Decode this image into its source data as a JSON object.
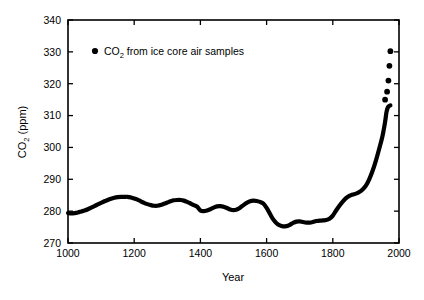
{
  "chart_data": {
    "type": "scatter",
    "title": "",
    "xlabel": "Year",
    "ylabel": "CO2 (ppm)",
    "ylabel_base": "CO",
    "ylabel_sub": "2",
    "ylabel_unit": " (ppm)",
    "xlim": [
      1000,
      2000
    ],
    "ylim": [
      270,
      340
    ],
    "grid": false,
    "legend_position": "upper-left-inside",
    "marker_color": "#000000",
    "xticks": [
      1000,
      1200,
      1400,
      1600,
      1800,
      2000
    ],
    "xtick_labels": [
      "1000",
      "1200",
      "1400",
      "1600",
      "1800",
      "2000"
    ],
    "yticks": [
      270,
      280,
      290,
      300,
      310,
      320,
      330,
      340
    ],
    "ytick_labels": [
      "270",
      "280",
      "290",
      "300",
      "310",
      "320",
      "330",
      "340"
    ],
    "legend": [
      {
        "marker": "filled-circle",
        "label": "CO2 from ice core air samples",
        "label_base": "CO",
        "label_sub": "2",
        "label_rest": " from ice core air samples"
      }
    ],
    "series": [
      {
        "name": "CO2 from ice core air samples",
        "x": [
          1000,
          1010,
          1020,
          1030,
          1040,
          1050,
          1060,
          1070,
          1080,
          1090,
          1100,
          1110,
          1120,
          1130,
          1140,
          1150,
          1160,
          1170,
          1180,
          1190,
          1200,
          1210,
          1220,
          1230,
          1240,
          1250,
          1260,
          1270,
          1280,
          1290,
          1300,
          1310,
          1320,
          1330,
          1340,
          1350,
          1360,
          1370,
          1380,
          1390,
          1400,
          1410,
          1420,
          1430,
          1440,
          1450,
          1460,
          1470,
          1480,
          1490,
          1500,
          1510,
          1520,
          1530,
          1540,
          1550,
          1560,
          1570,
          1580,
          1590,
          1600,
          1610,
          1620,
          1630,
          1640,
          1650,
          1660,
          1670,
          1680,
          1690,
          1700,
          1710,
          1720,
          1730,
          1740,
          1750,
          1760,
          1770,
          1780,
          1790,
          1800,
          1810,
          1820,
          1830,
          1840,
          1850,
          1860,
          1870,
          1880,
          1890,
          1900,
          1910,
          1920,
          1930,
          1940,
          1950,
          1958,
          1962,
          1966,
          1970,
          1974
        ],
        "y": [
          279.4,
          279.3,
          279.4,
          279.6,
          279.9,
          280.2,
          280.6,
          281.1,
          281.6,
          282.1,
          282.6,
          283.1,
          283.5,
          283.9,
          284.2,
          284.4,
          284.5,
          284.5,
          284.5,
          284.3,
          284.0,
          283.6,
          283.1,
          282.6,
          282.2,
          281.9,
          281.7,
          281.7,
          281.9,
          282.3,
          282.7,
          283.1,
          283.4,
          283.5,
          283.5,
          283.3,
          282.9,
          282.4,
          281.9,
          281.4,
          280.2,
          280.0,
          280.2,
          280.6,
          281.1,
          281.5,
          281.6,
          281.4,
          281.0,
          280.5,
          280.3,
          280.5,
          281.1,
          281.9,
          282.6,
          283.1,
          283.3,
          283.2,
          282.9,
          282.4,
          281.0,
          279.2,
          277.4,
          276.2,
          275.5,
          275.2,
          275.3,
          275.7,
          276.3,
          276.7,
          276.8,
          276.6,
          276.4,
          276.4,
          276.6,
          276.9,
          277.0,
          277.1,
          277.2,
          277.6,
          278.6,
          280.2,
          281.7,
          283.0,
          284.1,
          284.8,
          285.2,
          285.5,
          286.0,
          286.8,
          288.0,
          290.0,
          292.6,
          295.8,
          299.5,
          303.5,
          308.0,
          311.0,
          312.5,
          313.0,
          313.2
        ],
        "marker": "filled-circle",
        "note": "dense ice-core record rendered as a continuous thick black trace"
      },
      {
        "name": "recent discrete samples",
        "x": [
          1958,
          1964,
          1968,
          1971,
          1974
        ],
        "y": [
          315.0,
          317.5,
          321.0,
          325.6,
          330.2
        ],
        "marker": "filled-circle",
        "note": "separated dots at upper right"
      }
    ]
  }
}
